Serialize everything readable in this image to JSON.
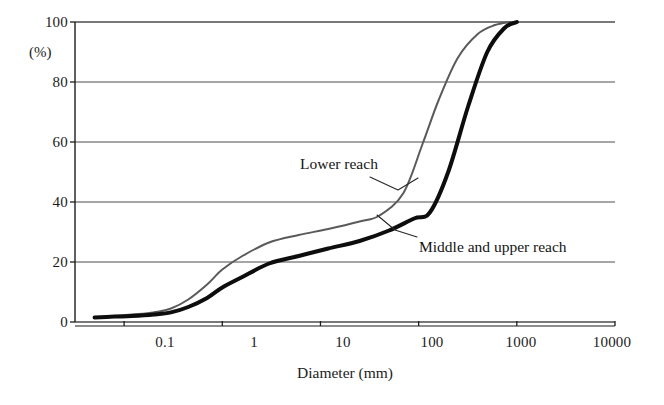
{
  "chart_data": {
    "type": "line",
    "title": "",
    "subtitle": "",
    "xlabel": "Diameter (mm)",
    "ylabel": "(%)",
    "xscale": "log",
    "yscale": "linear",
    "xlim": [
      0.0316,
      10000
    ],
    "ylim": [
      0,
      100
    ],
    "grid": "horizontal",
    "legend_position": "inline-annotations",
    "x_ticks": [
      0.1,
      1,
      10,
      100,
      1000,
      10000
    ],
    "x_tick_labels": [
      "0.1",
      "1",
      "10",
      "100",
      "1000",
      "10000"
    ],
    "y_ticks": [
      0,
      20,
      40,
      60,
      80,
      100
    ],
    "y_tick_labels": [
      "0",
      "20",
      "40",
      "60",
      "80",
      "100"
    ],
    "series": [
      {
        "name": "Lower reach",
        "color": "#5a5a5a",
        "width": 2.0,
        "x": [
          0.05,
          0.08,
          0.12,
          0.2,
          0.3,
          0.45,
          0.7,
          1.0,
          1.6,
          3.0,
          6.0,
          12,
          25,
          40,
          70,
          110,
          160,
          250,
          400,
          600,
          850
        ],
        "y": [
          1.5,
          2.0,
          2.5,
          3.2,
          4.5,
          7.5,
          12.5,
          17.5,
          22.0,
          26.5,
          29.0,
          31.0,
          33.5,
          35.5,
          43.0,
          59.5,
          74.0,
          88.0,
          96.0,
          99.0,
          100.0
        ]
      },
      {
        "name": "Middle and  upper reach",
        "color": "#0d0d0d",
        "width": 4.0,
        "x": [
          0.05,
          0.08,
          0.12,
          0.2,
          0.3,
          0.45,
          0.7,
          1.0,
          1.6,
          3.0,
          6.0,
          12,
          25,
          50,
          90,
          130,
          200,
          320,
          500,
          750,
          1000
        ],
        "y": [
          1.5,
          1.8,
          2.0,
          2.5,
          3.2,
          5.0,
          8.0,
          11.5,
          15.0,
          19.5,
          22.0,
          24.5,
          27.0,
          30.5,
          34.5,
          36.5,
          50.0,
          72.0,
          90.0,
          98.0,
          100.0
        ]
      }
    ],
    "annotations": [
      {
        "text": "Lower reach",
        "label_x_px": 300,
        "label_y_px": 155,
        "leader": [
          [
            370,
            177
          ],
          [
            398,
            190
          ],
          [
            418,
            178
          ]
        ]
      },
      {
        "text": "Middle and  upper reach",
        "label_x_px": 419,
        "label_y_px": 238,
        "leader": [
          [
            417,
            237
          ],
          [
            395,
            230
          ],
          [
            377,
            215
          ]
        ]
      }
    ]
  },
  "axes": {
    "y_unit_label": "(%)",
    "x_axis_title": "Diameter (mm)"
  },
  "colors": {
    "background": "#ffffff",
    "axis": "#1c1c1c",
    "grid": "#4d4d4d",
    "series_lower_reach": "#5a5a5a",
    "series_middle_upper_reach": "#0d0d0d"
  }
}
